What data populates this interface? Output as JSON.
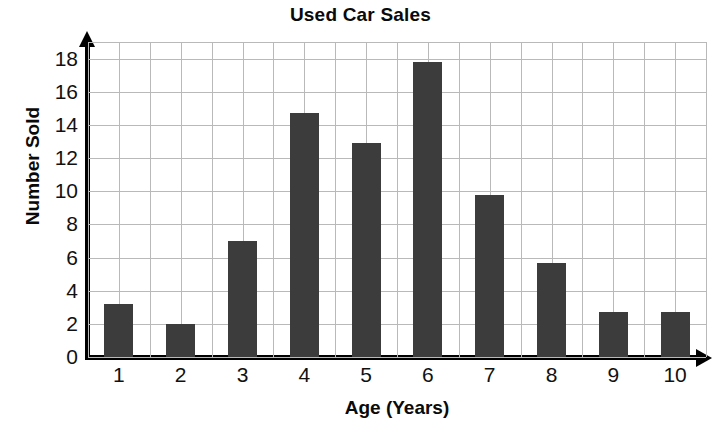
{
  "chart_data": {
    "type": "bar",
    "title": "Used Car Sales",
    "xlabel": "Age (Years)",
    "ylabel": "Number Sold",
    "categories": [
      "1",
      "2",
      "3",
      "4",
      "5",
      "6",
      "7",
      "8",
      "9",
      "10"
    ],
    "values": [
      3.2,
      2.0,
      7.0,
      14.7,
      12.9,
      17.8,
      9.8,
      5.7,
      2.7,
      2.7
    ],
    "xlim": [
      0.5,
      10.5
    ],
    "ylim": [
      0,
      19
    ],
    "yticks": [
      "0",
      "2",
      "4",
      "6",
      "8",
      "10",
      "12",
      "14",
      "16",
      "18"
    ],
    "ytick_values": [
      0,
      2,
      4,
      6,
      8,
      10,
      12,
      14,
      16,
      18
    ],
    "grid": true,
    "legend": null,
    "bar_color": "#3c3c3c",
    "grid_color": "#b9b9b9",
    "axis_color": "#000000",
    "background_color": "#ffffff"
  }
}
